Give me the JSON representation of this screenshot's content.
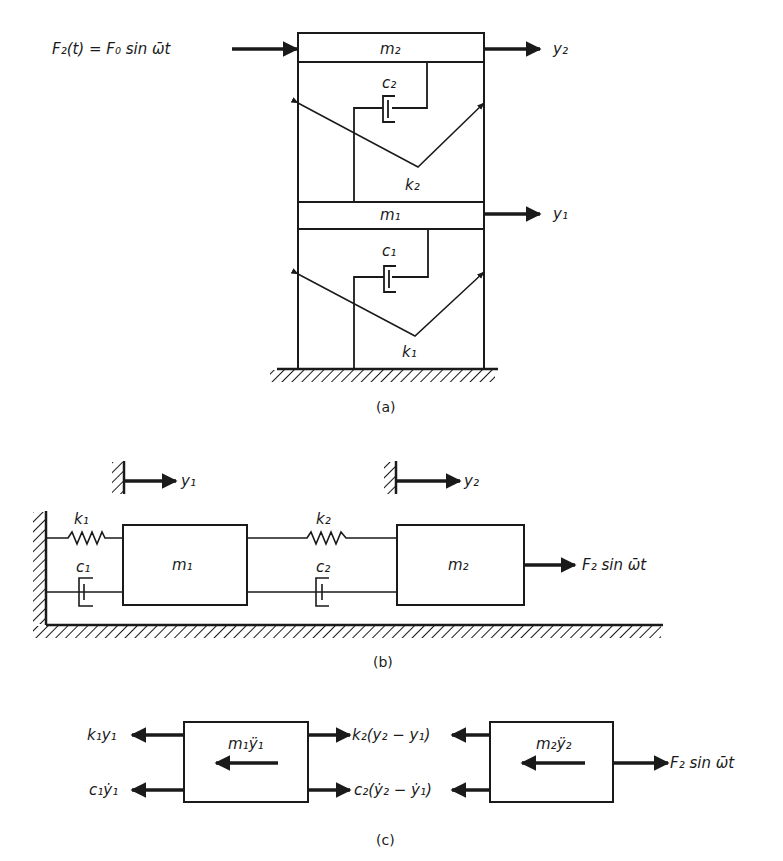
{
  "figure": {
    "part_a": {
      "caption": "(a)",
      "force_label": "F₂(t) = F₀ sin ω̄t",
      "mass_top": "m₂",
      "mass_bottom": "m₁",
      "damper_top": "c₂",
      "spring_top": "k₂",
      "damper_bottom": "c₁",
      "spring_bottom": "k₁",
      "disp_top": "y₂",
      "disp_bottom": "y₁"
    },
    "part_b": {
      "caption": "(b)",
      "ref_1": "y₁",
      "ref_2": "y₂",
      "spring_1": "k₁",
      "damper_1": "c₁",
      "mass_1": "m₁",
      "spring_2": "k₂",
      "damper_2": "c₂",
      "mass_2": "m₂",
      "force": "F₂ sin ω̄t"
    },
    "part_c": {
      "caption": "(c)",
      "left_top": "k₁y₁",
      "left_bottom": "c₁ẏ₁",
      "mass_1_inertia": "m₁ÿ₁",
      "mid_top": "k₂(y₂ − y₁)",
      "mid_bottom": "c₂(ẏ₂ − ẏ₁)",
      "mass_2_inertia": "m₂ÿ₂",
      "force": "F₂ sin ω̄t"
    }
  },
  "colors": {
    "ink": "#1a1a1a",
    "background": "#ffffff"
  }
}
